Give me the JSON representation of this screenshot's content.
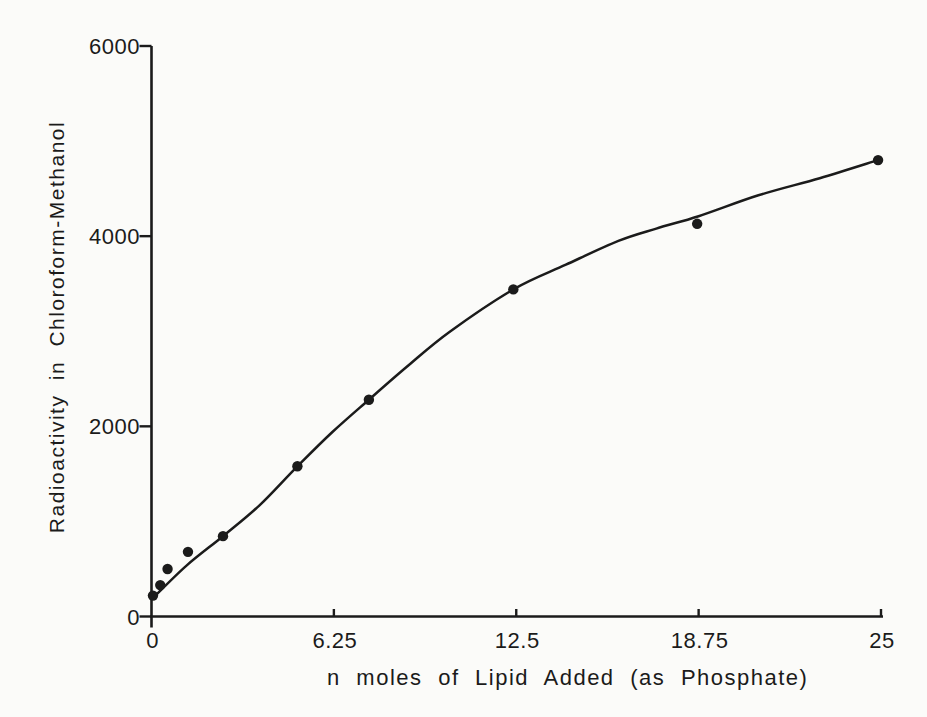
{
  "figure": {
    "paper_color": "#fbfbf9",
    "ink_color": "#1b1b1b"
  },
  "chart_data": {
    "type": "scatter",
    "title": "",
    "xlabel": "n moles of Lipid Added (as Phosphate)",
    "ylabel": "Radioactivity in Chloroform-Methanol",
    "xlim": [
      0,
      25
    ],
    "ylim": [
      0,
      6000
    ],
    "grid": false,
    "legend": "none",
    "x_ticks": [
      {
        "value": 0,
        "label": "0"
      },
      {
        "value": 6.25,
        "label": "6.25"
      },
      {
        "value": 12.5,
        "label": "12.5"
      },
      {
        "value": 18.75,
        "label": "18.75"
      },
      {
        "value": 25,
        "label": "25"
      }
    ],
    "y_ticks": [
      {
        "value": 0,
        "label": "0"
      },
      {
        "value": 2000,
        "label": "2000"
      },
      {
        "value": 4000,
        "label": "4000"
      },
      {
        "value": 6000,
        "label": "6000"
      }
    ],
    "series": [
      {
        "name": "radioactivity-vs-lipid",
        "marker": "filled-circle",
        "points": [
          {
            "x": 0.05,
            "y": 220
          },
          {
            "x": 0.3,
            "y": 330
          },
          {
            "x": 0.55,
            "y": 500
          },
          {
            "x": 1.25,
            "y": 680
          },
          {
            "x": 2.45,
            "y": 845
          },
          {
            "x": 5.0,
            "y": 1580
          },
          {
            "x": 7.45,
            "y": 2280
          },
          {
            "x": 12.4,
            "y": 3440
          },
          {
            "x": 18.7,
            "y": 4130
          },
          {
            "x": 24.9,
            "y": 4800
          }
        ]
      }
    ],
    "fit_curve": {
      "description": "smooth saturating curve drawn through the data",
      "samples": [
        {
          "x": 0.05,
          "y": 195
        },
        {
          "x": 1.2,
          "y": 535
        },
        {
          "x": 2.45,
          "y": 845
        },
        {
          "x": 3.7,
          "y": 1170
        },
        {
          "x": 5.0,
          "y": 1580
        },
        {
          "x": 6.2,
          "y": 1940
        },
        {
          "x": 7.45,
          "y": 2280
        },
        {
          "x": 8.8,
          "y": 2640
        },
        {
          "x": 10.2,
          "y": 2990
        },
        {
          "x": 12.4,
          "y": 3440
        },
        {
          "x": 14.2,
          "y": 3700
        },
        {
          "x": 16.0,
          "y": 3950
        },
        {
          "x": 17.3,
          "y": 4080
        },
        {
          "x": 18.75,
          "y": 4210
        },
        {
          "x": 20.8,
          "y": 4430
        },
        {
          "x": 22.9,
          "y": 4610
        },
        {
          "x": 24.9,
          "y": 4800
        }
      ]
    }
  }
}
